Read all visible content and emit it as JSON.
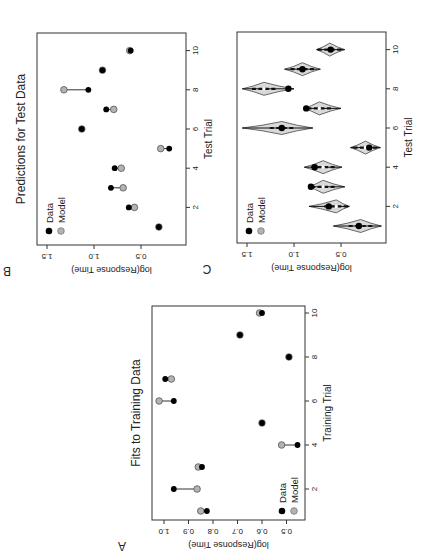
{
  "figure": {
    "orientation": "rotated 90 degrees counter-clockwise",
    "colors": {
      "data": "#000000",
      "model": "#b3b3b3",
      "violin_fill": "#d9d9d9",
      "line": "#333333"
    }
  },
  "panels": {
    "A": {
      "label": "A",
      "title": "Fits to Training Data",
      "xlabel": "Training Trial",
      "ylabel": "log(Response Time)",
      "x_ticks": [
        "2",
        "4",
        "6",
        "8",
        "10"
      ],
      "y_ticks": [
        "0.5",
        "0.6",
        "0.7",
        "0.8",
        "0.9",
        "1.0"
      ],
      "legend": [
        "Data",
        "Model"
      ]
    },
    "B": {
      "label": "B",
      "title": "Predictions for Test Data",
      "xlabel": "Test Trial",
      "ylabel": "log(Response Time)",
      "x_ticks": [
        "2",
        "4",
        "6",
        "8",
        "10"
      ],
      "y_ticks": [
        "0.5",
        "1.0",
        "1.5"
      ],
      "legend": [
        "Data",
        "Model"
      ]
    },
    "C": {
      "label": "C",
      "title": "",
      "xlabel": "Test Trial",
      "ylabel": "log(Response Time)",
      "x_ticks": [
        "2",
        "4",
        "6",
        "8",
        "10"
      ],
      "y_ticks": [
        "0.5",
        "1.0",
        "1.5"
      ],
      "legend": [
        "Data",
        "Model"
      ]
    }
  },
  "chart_data": [
    {
      "panel": "A",
      "type": "scatter",
      "title": "Fits to Training Data",
      "xlabel": "Training Trial",
      "ylabel": "log(Response Time)",
      "x": [
        1,
        2,
        3,
        4,
        5,
        6,
        7,
        8,
        9,
        10
      ],
      "series": [
        {
          "name": "Data",
          "values": [
            0.825,
            0.96,
            0.845,
            0.455,
            0.6,
            0.96,
            0.995,
            0.49,
            0.69,
            0.6
          ]
        },
        {
          "name": "Model",
          "values": [
            0.85,
            0.865,
            0.86,
            0.52,
            0.6,
            1.02,
            0.97,
            0.49,
            0.69,
            0.61
          ]
        }
      ],
      "xlim": [
        0.5,
        10.5
      ],
      "ylim": [
        0.45,
        1.03
      ],
      "legend_position": "bottom-left",
      "grid": false
    },
    {
      "panel": "B",
      "type": "scatter",
      "title": "Predictions for Test Data",
      "xlabel": "Test Trial",
      "ylabel": "log(Response Time)",
      "x": [
        1,
        2,
        3,
        4,
        5,
        6,
        7,
        8,
        9,
        10
      ],
      "series": [
        {
          "name": "Data",
          "values": [
            0.31,
            0.63,
            0.82,
            0.78,
            0.2,
            1.13,
            0.87,
            1.06,
            0.91,
            0.61
          ]
        },
        {
          "name": "Model",
          "values": [
            0.31,
            0.57,
            0.69,
            0.71,
            0.29,
            1.13,
            0.79,
            1.32,
            0.91,
            0.62
          ]
        }
      ],
      "xlim": [
        0.5,
        10.5
      ],
      "ylim": [
        0.1,
        1.55
      ],
      "legend_position": "top-left",
      "grid": false
    },
    {
      "panel": "C",
      "type": "violin",
      "xlabel": "Test Trial",
      "ylabel": "log(Response Time)",
      "x": [
        1,
        2,
        3,
        4,
        5,
        6,
        7,
        8,
        9,
        10
      ],
      "series": [
        {
          "name": "Data",
          "values": [
            0.31,
            0.63,
            0.82,
            0.78,
            0.2,
            1.13,
            0.87,
            1.06,
            0.91,
            0.61
          ]
        },
        {
          "name": "Model median",
          "values": [
            0.29,
            0.55,
            0.69,
            0.69,
            0.24,
            1.13,
            0.73,
            1.32,
            0.91,
            0.62
          ]
        }
      ],
      "violin_ranges": [
        [
          0.07,
          0.58
        ],
        [
          0.41,
          0.84
        ],
        [
          0.46,
          0.85
        ],
        [
          0.49,
          0.89
        ],
        [
          0.08,
          0.4
        ],
        [
          0.8,
          1.55
        ],
        [
          0.5,
          0.9
        ],
        [
          1.0,
          1.55
        ],
        [
          0.72,
          1.1
        ],
        [
          0.46,
          0.76
        ]
      ],
      "xlim": [
        0.5,
        10.5
      ],
      "ylim": [
        0.05,
        1.55
      ],
      "legend_position": "top-left",
      "grid": false
    }
  ]
}
